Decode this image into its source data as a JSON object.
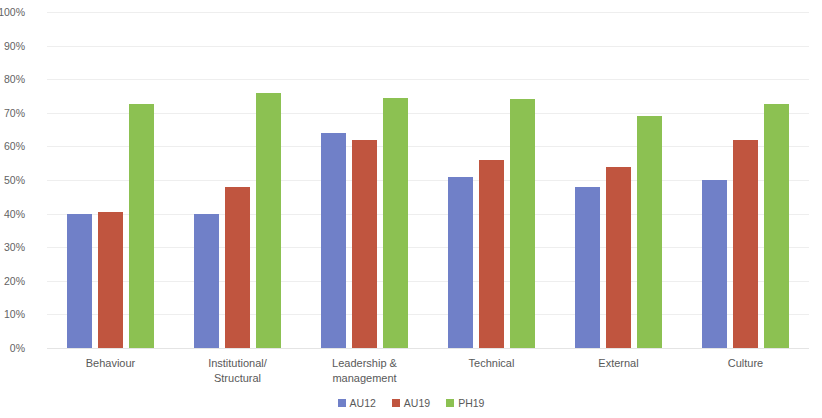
{
  "chart_data": {
    "type": "bar",
    "title": "",
    "subtitle": "",
    "xlabel": "",
    "ylabel": "",
    "ylim": [
      0,
      100
    ],
    "y_tick_labels": [
      "100%",
      "90%",
      "80%",
      "70%",
      "60%",
      "50%",
      "40%",
      "30%",
      "20%",
      "10%",
      "0%"
    ],
    "y_tick_values": [
      100,
      90,
      80,
      70,
      60,
      50,
      40,
      30,
      20,
      10,
      0
    ],
    "y_unit": "%",
    "grid": true,
    "grid_axis": "y",
    "legend_position": "bottom-center",
    "categories": [
      "Behaviour",
      "Institutional/\nStructural",
      "Leadership &\nmanagement",
      "Technical",
      "External",
      "Culture"
    ],
    "series": [
      {
        "name": "AU12",
        "color": "#7080c8",
        "values": [
          40,
          40,
          64,
          51,
          48,
          50
        ]
      },
      {
        "name": "AU19",
        "color": "#c0553f",
        "values": [
          40.5,
          48,
          62,
          56,
          54,
          62
        ]
      },
      {
        "name": "PH19",
        "color": "#8cc152",
        "values": [
          72.5,
          76,
          74.5,
          74,
          69,
          72.5
        ]
      }
    ]
  }
}
